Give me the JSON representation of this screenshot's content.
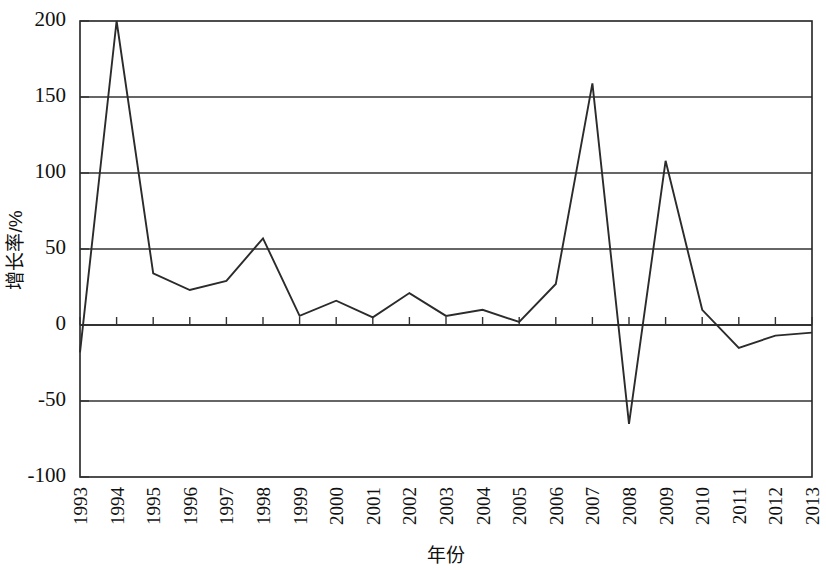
{
  "chart_data": {
    "type": "line",
    "title": "",
    "xlabel": "年份",
    "ylabel": "增长率/%",
    "categories": [
      "1993",
      "1994",
      "1995",
      "1996",
      "1997",
      "1998",
      "1999",
      "2000",
      "2001",
      "2002",
      "2003",
      "2004",
      "2005",
      "2006",
      "2007",
      "2008",
      "2009",
      "2010",
      "2011",
      "2012",
      "2013"
    ],
    "values": [
      -18,
      200,
      34,
      23,
      29,
      57,
      6,
      16,
      5,
      21,
      6,
      10,
      2,
      27,
      159,
      -65,
      108,
      10,
      -15,
      -7,
      -5
    ],
    "series": [
      {
        "name": "增长率",
        "values": [
          -18,
          200,
          34,
          23,
          29,
          57,
          6,
          16,
          5,
          21,
          6,
          10,
          2,
          27,
          159,
          -65,
          108,
          10,
          -15,
          -7,
          -5
        ]
      }
    ],
    "ylim": [
      -100,
      200
    ],
    "yticks": [
      -100,
      -50,
      0,
      50,
      100,
      150,
      200
    ],
    "ytick_labels": [
      "-100",
      "-50",
      "0",
      "50",
      "100",
      "150",
      "200"
    ],
    "grid": true,
    "grid_axis": "y",
    "legend": "none",
    "line_color": "#2b2b2b",
    "markers": "none"
  },
  "axes": {
    "y_label": "增长率/%",
    "x_label": "年份"
  }
}
